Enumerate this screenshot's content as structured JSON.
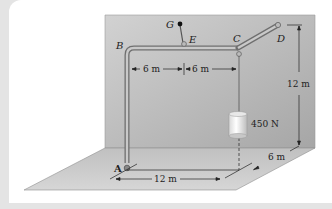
{
  "figure": {
    "points": {
      "A": "A",
      "B": "B",
      "C": "C",
      "D": "D",
      "E": "E",
      "G": "G"
    },
    "dimensions": {
      "BE": "6 m",
      "EC": "6 m",
      "height": "12 m",
      "depth": "6 m",
      "floor_length": "12 m"
    },
    "load": "450 N",
    "colors": {
      "wall": "#b5b5b5",
      "floor": "#cfcfcf",
      "pipe": "#8a8a8a",
      "background": "#e4e4e4",
      "card": "#ffffff"
    }
  }
}
